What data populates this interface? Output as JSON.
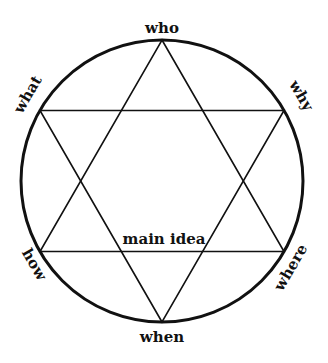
{
  "diagram": {
    "type": "star-of-david-in-circle",
    "center_label": "main idea",
    "vertices": {
      "top": "who",
      "upper_right": "why",
      "lower_right": "where",
      "bottom": "when",
      "lower_left": "how",
      "upper_left": "what"
    },
    "colors": {
      "stroke": "#111111",
      "text": "#111111",
      "background": "#ffffff"
    }
  }
}
